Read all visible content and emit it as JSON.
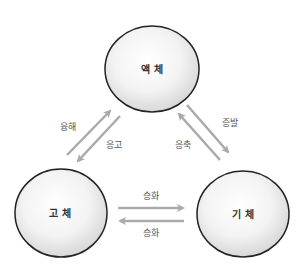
{
  "diagram": {
    "type": "state-transition-cycle",
    "colors": {
      "circle_stroke": "#222222",
      "circle_fill_center": "#ffffff",
      "circle_fill_edge": "#dcdcdc",
      "arrow": "#aaaaaa",
      "state_text": "#333333",
      "transition_text": "#555555"
    },
    "states": [
      {
        "id": "liquid",
        "label": "액 체"
      },
      {
        "id": "solid",
        "label": "고 체"
      },
      {
        "id": "gas",
        "label": "기 체"
      }
    ],
    "transitions": [
      {
        "from": "solid",
        "to": "liquid",
        "label": "융해"
      },
      {
        "from": "liquid",
        "to": "solid",
        "label": "응고"
      },
      {
        "from": "liquid",
        "to": "gas",
        "label": "증발"
      },
      {
        "from": "gas",
        "to": "liquid",
        "label": "응축"
      },
      {
        "from": "solid",
        "to": "gas",
        "label": "승화"
      },
      {
        "from": "gas",
        "to": "solid",
        "label": "승화"
      }
    ]
  }
}
